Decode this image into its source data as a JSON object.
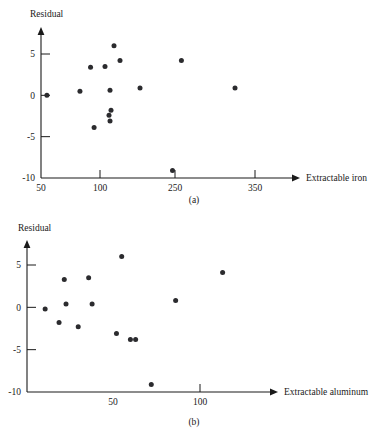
{
  "figure": {
    "background_color": "#ffffff",
    "ink_color": "#1a1a1a",
    "point_color": "#2b2b2e"
  },
  "panel_a": {
    "caption": "(a)",
    "ylabel": "Residual",
    "xlabel": "Extractable iron"
  },
  "panel_b": {
    "caption": "(b)",
    "ylabel": "Residual",
    "xlabel": "Extractable aluminum"
  },
  "chart_data": [
    {
      "type": "scatter",
      "title": "(a)",
      "xlabel": "Extractable iron",
      "ylabel": "Residual",
      "xticks": [
        50,
        100,
        250,
        350
      ],
      "xtick_labels": [
        "50",
        "100",
        "250",
        "350"
      ],
      "yticks": [
        5,
        0,
        -5,
        -10
      ],
      "ytick_labels": [
        "5",
        "0",
        "-5",
        "-10"
      ],
      "xlim": [
        50,
        380
      ],
      "ylim": [
        -10,
        7
      ],
      "grid": false,
      "legend": null,
      "x": [
        55,
        83,
        92,
        95,
        110,
        118,
        120,
        120,
        122,
        128,
        140,
        180,
        245,
        258,
        325
      ],
      "y": [
        0.0,
        0.5,
        3.4,
        -3.9,
        3.5,
        -2.4,
        0.6,
        -3.1,
        -1.8,
        6.0,
        4.2,
        0.9,
        -9.1,
        4.2,
        0.9
      ]
    },
    {
      "type": "scatter",
      "title": "(b)",
      "xlabel": "Extractable aluminum",
      "ylabel": "Residual",
      "xticks": [
        50,
        100
      ],
      "xtick_labels": [
        "50",
        "100"
      ],
      "yticks": [
        5,
        0,
        -5,
        -10
      ],
      "ytick_labels": [
        "5",
        "0",
        "-5",
        "-10"
      ],
      "xlim": [
        0,
        135
      ],
      "ylim": [
        -10,
        7
      ],
      "grid": false,
      "legend": null,
      "x": [
        11,
        19,
        22,
        23,
        30,
        36,
        38,
        52,
        55,
        60,
        63,
        72,
        86,
        113
      ],
      "y": [
        -0.2,
        -1.8,
        3.3,
        0.4,
        -2.3,
        3.5,
        0.4,
        -3.1,
        6.0,
        -3.8,
        -3.8,
        -9.1,
        0.8,
        4.1
      ]
    }
  ]
}
